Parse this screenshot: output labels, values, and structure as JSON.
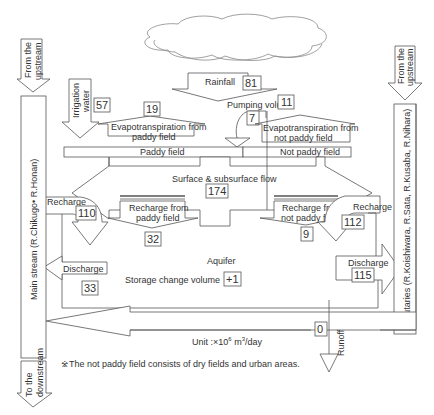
{
  "diagram": {
    "nodes": {
      "rainfall": {
        "label": "Rainfall",
        "value": "81"
      },
      "irrigation_water": {
        "label_line1": "Irrigation",
        "label_line2": "water",
        "value": "57"
      },
      "et_paddy": {
        "label_line1": "Evapotranspiration from",
        "label_line2": "paddy field",
        "value": "19"
      },
      "pumping": {
        "label": "Pumping volume",
        "value": "7"
      },
      "et_not_paddy": {
        "label_line1": "Evapotranspiration from",
        "label_line2": "not paddy field",
        "value": "11"
      },
      "paddy_field": {
        "label": "Paddy field"
      },
      "not_paddy_field": {
        "label": "Not paddy field"
      },
      "surface_flow": {
        "label": "Surface & subsurface flow",
        "value": "174"
      },
      "recharge_left": {
        "label": "Recharge",
        "value": "110"
      },
      "recharge_paddy": {
        "label_line1": "Recharge from",
        "label_line2": "paddy field",
        "value": "32"
      },
      "recharge_not_paddy": {
        "label_line1": "Recharge from",
        "label_line2": "not paddy field",
        "value": "9"
      },
      "recharge_right": {
        "label": "Recharge",
        "value": "112"
      },
      "aquifer": {
        "label": "Aquifer"
      },
      "storage_change": {
        "label": "Storage change volume",
        "value": "+1"
      },
      "discharge_left": {
        "label": "Discharge",
        "value": "33"
      },
      "discharge_right": {
        "label": "Discharge",
        "value": "115"
      },
      "runoff": {
        "label": "Runoff",
        "value": "0"
      },
      "main_stream": {
        "label": "Main stream (R.Chikugo• R.Honan)"
      },
      "tributaries": {
        "label": "Tributaries (R.Koishiwara, R.Sata, R.Kusaba, R.Nihara)"
      },
      "from_upstream_left": {
        "line1": "From the",
        "line2": "upstream"
      },
      "from_upstream_right": {
        "line1": "From the",
        "line2": "upstream"
      },
      "to_downstream": {
        "line1": "To the",
        "line2": "downstream"
      }
    },
    "unit": {
      "prefix": "Unit :×10",
      "exp": "6",
      "mid": " m",
      "exp2": "3",
      "suffix": "/day"
    },
    "footnote": "※The not paddy field consists of dry fields and urban areas.",
    "colors": {
      "stroke": "#555555",
      "text": "#333333",
      "background": "#ffffff"
    }
  }
}
